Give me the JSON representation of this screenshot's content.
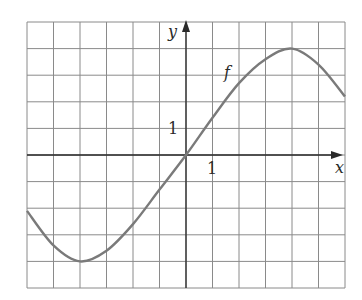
{
  "chart_data": {
    "type": "line",
    "title": "",
    "xlabel": "x",
    "ylabel": "y",
    "xlim": [
      -6,
      6
    ],
    "ylim": [
      -5,
      5
    ],
    "grid": true,
    "tick_labels": {
      "x": "1",
      "y": "1"
    },
    "series": [
      {
        "name": "f",
        "x": [
          -6,
          -5,
          -4,
          -3,
          -2,
          -1,
          0,
          1,
          2,
          3,
          4,
          5,
          6
        ],
        "values": [
          -2.1,
          -3.4,
          -4,
          -3.6,
          -2.6,
          -1.3,
          0,
          1.4,
          2.7,
          3.6,
          4,
          3.4,
          2.2
        ]
      }
    ],
    "annotations": [
      {
        "text": "f",
        "x": 1.6,
        "y": 3.1
      }
    ]
  },
  "labels": {
    "x_axis": "x",
    "y_axis": "y",
    "x_tick": "1",
    "y_tick": "1",
    "curve": "f"
  },
  "colors": {
    "curve": "#7a7a7a",
    "grid": "#8a8a8a",
    "axis": "#2a2a2a"
  }
}
